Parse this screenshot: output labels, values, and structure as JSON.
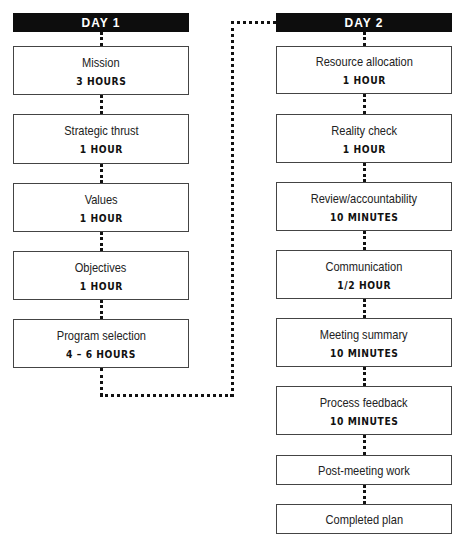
{
  "days": [
    {
      "label": "DAY 1",
      "steps": [
        {
          "title": "Mission",
          "duration": "3 HOURS"
        },
        {
          "title": "Strategic thrust",
          "duration": "1 HOUR"
        },
        {
          "title": "Values",
          "duration": "1 HOUR"
        },
        {
          "title": "Objectives",
          "duration": "1 HOUR"
        },
        {
          "title": "Program selection",
          "duration": "4 – 6 HOURS"
        }
      ]
    },
    {
      "label": "DAY 2",
      "steps": [
        {
          "title": "Resource allocation",
          "duration": "1 HOUR"
        },
        {
          "title": "Reality check",
          "duration": "1 HOUR"
        },
        {
          "title": "Review/accountability",
          "duration": "10 MINUTES"
        },
        {
          "title": "Communication",
          "duration": "1/2 HOUR"
        },
        {
          "title": "Meeting summary",
          "duration": "10 MINUTES"
        },
        {
          "title": "Process feedback",
          "duration": "10 MINUTES"
        },
        {
          "title": "Post-meeting work"
        },
        {
          "title": "Completed plan"
        }
      ]
    }
  ],
  "colors": {
    "header_bg": "#0d0d0d",
    "header_text": "#ffffff",
    "border": "#444444",
    "connector": "#111111"
  }
}
